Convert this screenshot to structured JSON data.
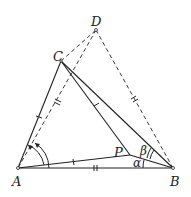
{
  "diagram": {
    "type": "geometry",
    "points": {
      "A": {
        "label": "A",
        "x": 18,
        "y": 168
      },
      "B": {
        "label": "B",
        "x": 173,
        "y": 168
      },
      "C": {
        "label": "C",
        "x": 61,
        "y": 61
      },
      "D": {
        "label": "D",
        "x": 96,
        "y": 30
      },
      "P": {
        "label": "P",
        "x": 130,
        "y": 155
      }
    },
    "angles": {
      "alpha": "α",
      "beta": "β"
    },
    "segments_solid": [
      "AB",
      "AC",
      "CB",
      "CP",
      "PA",
      "PB"
    ],
    "segments_dashed": [
      "CD",
      "DA",
      "DB"
    ],
    "colors": {
      "stroke": "#222222",
      "background": "#ffffff"
    }
  }
}
